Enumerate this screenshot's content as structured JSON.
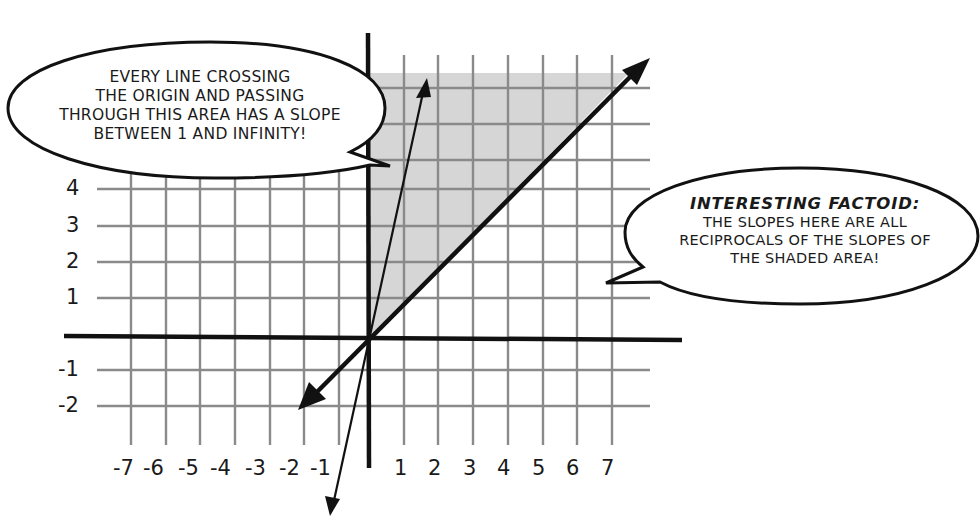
{
  "bubble_left": {
    "lines": [
      "EVERY LINE CROSSING",
      "THE ORIGIN AND PASSING",
      "THROUGH THIS AREA HAS A SLOPE",
      "BETWEEN 1 AND INFINITY!"
    ]
  },
  "bubble_right": {
    "title": "INTERESTING FACTOID:",
    "lines": [
      "THE SLOPES HERE ARE ALL",
      "RECIPROCALS OF THE SLOPES OF",
      "THE SHADED AREA!"
    ]
  },
  "axes": {
    "x_ticks": [
      "-7",
      "-6",
      "-5",
      "-4",
      "-3",
      "-2",
      "-1",
      "1",
      "2",
      "3",
      "4",
      "5",
      "6",
      "7"
    ],
    "y_ticks_visible": [
      "4",
      "3",
      "2",
      "1",
      "-1",
      "-2"
    ]
  },
  "colors": {
    "grid": "#8a8a8a",
    "axis": "#111111",
    "shade": "#d6d6d6",
    "ink": "#1a1a1a"
  },
  "lines": [
    {
      "name": "y = x",
      "slope": 1,
      "arrows": "both"
    },
    {
      "name": "steep line",
      "slope": 5,
      "arrows": "both"
    }
  ],
  "shaded_region": "triangle between positive y-axis and line y=x (slopes from 1 to infinity)"
}
